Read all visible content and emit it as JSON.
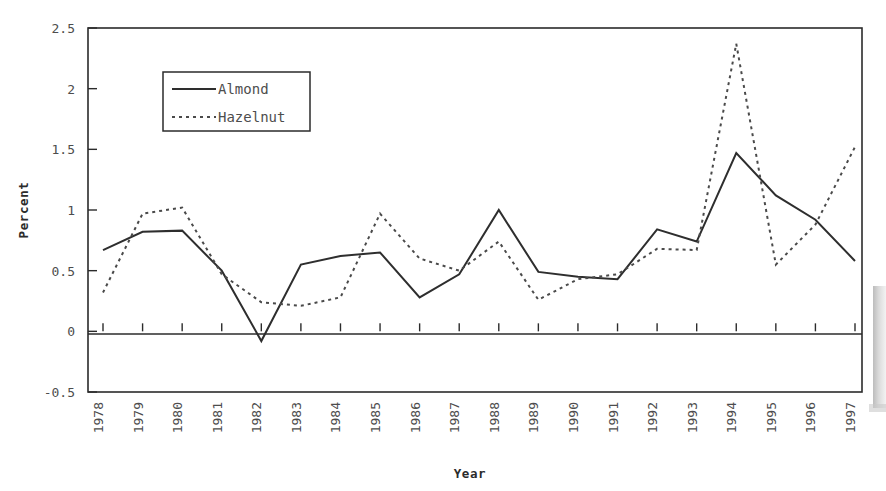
{
  "chart_data": {
    "type": "line",
    "title": "",
    "xlabel": "Year",
    "ylabel": "Percent",
    "categories": [
      "1978",
      "1979",
      "1980",
      "1981",
      "1982",
      "1983",
      "1984",
      "1985",
      "1986",
      "1987",
      "1988",
      "1989",
      "1990",
      "1991",
      "1992",
      "1993",
      "1994",
      "1995",
      "1996",
      "1997"
    ],
    "x": [
      1978,
      1979,
      1980,
      1981,
      1982,
      1983,
      1984,
      1985,
      1986,
      1987,
      1988,
      1989,
      1990,
      1991,
      1992,
      1993,
      1994,
      1995,
      1996,
      1997
    ],
    "series": [
      {
        "name": "Almond",
        "style": "solid",
        "color": "#2e2e2e",
        "values": [
          0.67,
          0.82,
          0.83,
          0.5,
          -0.08,
          0.55,
          0.62,
          0.65,
          0.28,
          0.47,
          1.0,
          0.49,
          0.45,
          0.43,
          0.84,
          0.74,
          1.47,
          1.12,
          0.92,
          0.58
        ]
      },
      {
        "name": "Hazelnut",
        "style": "dotted",
        "color": "#4a4a4a",
        "values": [
          0.32,
          0.97,
          1.02,
          0.47,
          0.24,
          0.21,
          0.28,
          0.97,
          0.6,
          0.5,
          0.74,
          0.26,
          0.43,
          0.47,
          0.68,
          0.67,
          2.37,
          0.55,
          0.88,
          1.52
        ]
      }
    ],
    "ylim": [
      -0.5,
      2.5
    ],
    "yticks": [
      -0.5,
      0,
      0.5,
      1,
      1.5,
      2,
      2.5
    ],
    "ytick_labels": [
      "-0.5",
      "0",
      "0.5",
      "1",
      "1.5",
      "2",
      "2.5"
    ],
    "xtick_labels": [
      "1978",
      "1979",
      "1980",
      "1981",
      "1982",
      "1983",
      "1984",
      "1985",
      "1986",
      "1987",
      "1988",
      "1989",
      "1990",
      "1991",
      "1992",
      "1993",
      "1994",
      "1995",
      "1996",
      "1997"
    ],
    "xtick_rotation": 90,
    "grid": false,
    "legend": {
      "position": "top-left-inside",
      "entries": [
        "Almond",
        "Hazelnut"
      ]
    },
    "notes": {
      "zero_reference_line": true,
      "xaxis_ticks_on_zero_line": true,
      "frame": "box"
    }
  },
  "axis": {
    "y_title": "Percent",
    "x_title": "Year"
  },
  "legend": {
    "almond_label": "Almond",
    "hazelnut_label": "Hazelnut"
  }
}
